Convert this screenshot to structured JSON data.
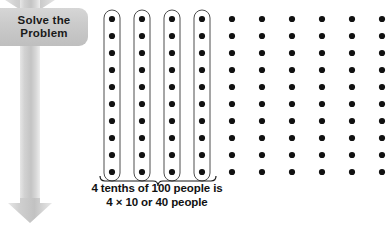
{
  "callout": {
    "banner_line1": "Solve the",
    "banner_line2": "Problem",
    "banner_bg": "#c9c9c9",
    "arrow_fill": "#cfcfcf",
    "arrow_name": "down-arrow-icon"
  },
  "caption": {
    "line1": "4 tenths of 100 people is",
    "line2": "4 × 10 or 40 people"
  },
  "chart_data": {
    "type": "pictograph",
    "title": "4 tenths of 100 people is 4 × 10 or 40 people",
    "dot_color": "#111111",
    "capsule_stroke": "#4d4d4d",
    "capsule_fill": "#ffffff",
    "columns_total": 10,
    "rows_per_column": 10,
    "dots_total": 100,
    "highlighted_columns": 4,
    "highlighted_dots": 40,
    "fraction_label": "4 tenths",
    "grid": {
      "first_dot_x": 112,
      "first_dot_y": 19,
      "column_spacing": 30,
      "row_spacing": 17,
      "dot_radius": 3.1
    },
    "brace": {
      "x_start": 100,
      "x_end": 216,
      "y": 176,
      "spans_columns": 4
    }
  }
}
